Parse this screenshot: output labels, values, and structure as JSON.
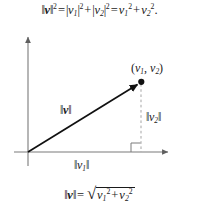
{
  "figure": {
    "background_color": "#ffffff",
    "axis_color": "#7a7a7a",
    "vector_color": "#111111",
    "dashed_color": "#9a9a9a",
    "text_color": "#1a1a1a"
  },
  "equations": {
    "top": {
      "norm_v": "v",
      "norm_v_exp": "2",
      "equals": "=",
      "abs_v1": "v",
      "abs_v1_idx": "1",
      "abs_v1_exp": "2",
      "plus": "+",
      "abs_v2": "v",
      "abs_v2_idx": "2",
      "abs_v2_exp": "2",
      "equals2": "=",
      "sq_v1": "v",
      "sq_v1_idx": "1",
      "sq_v1_exp": "2",
      "plus2": "+",
      "sq_v2": "v",
      "sq_v2_idx": "2",
      "sq_v2_exp": "2",
      "period": "."
    },
    "bottom": {
      "norm_v": "v",
      "equals": "=",
      "radical_sign": "√",
      "rad_v1": "v",
      "rad_v1_idx": "1",
      "rad_v1_exp": "2",
      "plus": "+",
      "rad_v2": "v",
      "rad_v2_idx": "2",
      "rad_v2_exp": "2"
    }
  },
  "diagram": {
    "point_label": {
      "open": "(",
      "v1": "v",
      "v1_idx": "1",
      "comma": ", ",
      "v2": "v",
      "v2_idx": "2",
      "close": ")"
    },
    "vector_label": {
      "name": "v"
    },
    "vertical_leg_label": {
      "name": "v",
      "idx": "2"
    },
    "horizontal_leg_label": {
      "name": "v",
      "idx": "1"
    },
    "geometry": {
      "origin_x": 28,
      "origin_y": 152,
      "tip_x": 141,
      "tip_y": 82,
      "x_axis_end": 172,
      "y_axis_top": 33,
      "x_axis_start": 14,
      "y_axis_bottom": 166,
      "right_angle_size": 9
    }
  }
}
